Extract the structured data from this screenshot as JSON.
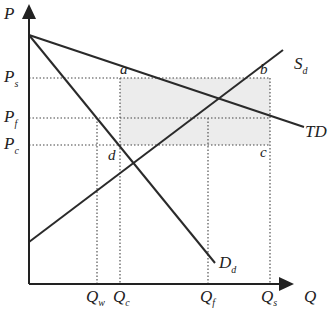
{
  "diagram": {
    "axes": {
      "y_label": "P",
      "x_label": "Q"
    },
    "price_labels": [
      {
        "id": "Ps",
        "main": "P",
        "sub": "s"
      },
      {
        "id": "Pf",
        "main": "P",
        "sub": "f"
      },
      {
        "id": "Pc",
        "main": "P",
        "sub": "c"
      }
    ],
    "quantity_labels": [
      {
        "id": "Qw",
        "main": "Q",
        "sub": "w"
      },
      {
        "id": "Qc",
        "main": "Q",
        "sub": "c"
      },
      {
        "id": "Qf",
        "main": "Q",
        "sub": "f"
      },
      {
        "id": "Qs",
        "main": "Q",
        "sub": "s"
      }
    ],
    "curves": [
      {
        "id": "TD",
        "main": "TD",
        "sub": ""
      },
      {
        "id": "Sd",
        "main": "S",
        "sub": "d"
      },
      {
        "id": "Dd",
        "main": "D",
        "sub": "d"
      }
    ],
    "points": [
      "a",
      "b",
      "c",
      "d"
    ],
    "shaded_region": "rectangle a-b-c between Ps and Pc from Qc to Qs",
    "shade_color": "#ececec"
  }
}
